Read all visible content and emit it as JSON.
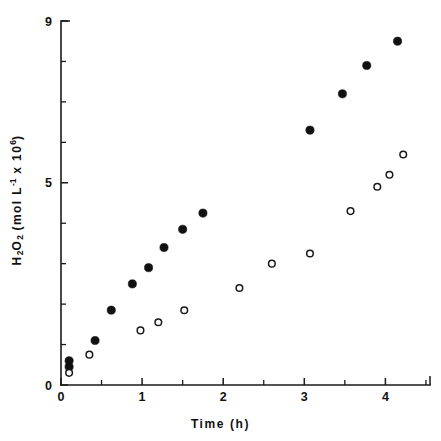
{
  "chart_data": {
    "type": "scatter",
    "title": "",
    "xlabel": "Time (h)",
    "ylabel": "H2O2 (mol L-1 x 106)",
    "ylabel_parts": {
      "species": "H",
      "sub1": "2",
      "species2": "O",
      "sub2": "2",
      "units_open": " (mol L",
      "sup1": "-1",
      "units_mid": " x 10",
      "sup2": "6",
      "units_close": ")"
    },
    "xlim": [
      0,
      4.55
    ],
    "ylim": [
      0,
      9
    ],
    "grid": false,
    "legend": "none",
    "x_major_ticks": [
      0,
      1,
      2,
      3,
      4
    ],
    "x_major_tick_labels": [
      "0",
      "1",
      "2",
      "3",
      "4"
    ],
    "x_minor_ticks": [
      0.5,
      1.5,
      2.5,
      3.5,
      4.5
    ],
    "y_major_ticks": [
      0,
      5,
      9
    ],
    "y_major_tick_labels": [
      "0",
      "5",
      "9"
    ],
    "y_minor_ticks": [
      1,
      2,
      3,
      4,
      6,
      7,
      8
    ],
    "series": [
      {
        "name": "filled-circles",
        "marker": "filled-circle",
        "color": "#111111",
        "points": [
          [
            0.1,
            0.6
          ],
          [
            0.1,
            0.45
          ],
          [
            0.42,
            1.1
          ],
          [
            0.62,
            1.85
          ],
          [
            0.88,
            2.5
          ],
          [
            1.08,
            2.9
          ],
          [
            1.27,
            3.4
          ],
          [
            1.5,
            3.85
          ],
          [
            1.75,
            4.25
          ],
          [
            3.07,
            6.3
          ],
          [
            3.47,
            7.2
          ],
          [
            3.77,
            7.9
          ],
          [
            4.15,
            8.5
          ]
        ]
      },
      {
        "name": "open-circles",
        "marker": "open-circle",
        "color": "#1a1a1a",
        "points": [
          [
            0.1,
            0.3
          ],
          [
            0.35,
            0.75
          ],
          [
            0.98,
            1.35
          ],
          [
            1.2,
            1.55
          ],
          [
            1.52,
            1.85
          ],
          [
            2.2,
            2.4
          ],
          [
            2.6,
            3.0
          ],
          [
            3.07,
            3.25
          ],
          [
            3.57,
            4.3
          ],
          [
            3.9,
            4.9
          ],
          [
            4.05,
            5.2
          ],
          [
            4.22,
            5.7
          ]
        ]
      }
    ]
  },
  "axes": {
    "x_title": "Time (h)"
  }
}
